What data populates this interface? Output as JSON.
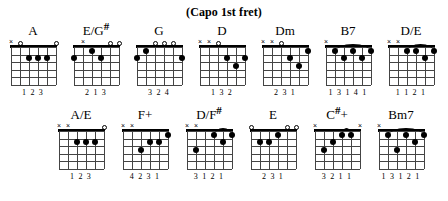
{
  "title": "(Capo 1st fret)",
  "layout": {
    "strings": 6,
    "frets": 5,
    "rows": 2
  },
  "rows": [
    {
      "row_index": 1,
      "chords": [
        {
          "name": "A",
          "name_base": "A",
          "name_sharp": "",
          "markers": [
            "x",
            "o",
            "",
            "",
            "",
            "o"
          ],
          "dots": [
            {
              "string": 4,
              "fret": 2
            },
            {
              "string": 3,
              "fret": 2
            },
            {
              "string": 2,
              "fret": 2
            }
          ],
          "barre": null,
          "fingering": "1 2 3"
        },
        {
          "name": "E/G#",
          "name_base": "E/G",
          "name_sharp": "#",
          "markers": [
            "",
            "x",
            "",
            "",
            "o",
            "o"
          ],
          "dots": [
            {
              "string": 6,
              "fret": 2
            },
            {
              "string": 4,
              "fret": 1
            },
            {
              "string": 3,
              "fret": 2
            }
          ],
          "barre": null,
          "fingering": "2  1 3"
        },
        {
          "name": "G",
          "name_base": "G",
          "name_sharp": "",
          "markers": [
            "",
            "",
            "o",
            "o",
            "o",
            ""
          ],
          "dots": [
            {
              "string": 6,
              "fret": 2
            },
            {
              "string": 5,
              "fret": 1
            },
            {
              "string": 1,
              "fret": 2
            }
          ],
          "barre": null,
          "fingering": "3 2      4"
        },
        {
          "name": "D",
          "name_base": "D",
          "name_sharp": "",
          "markers": [
            "x",
            "x",
            "o",
            "",
            "",
            ""
          ],
          "dots": [
            {
              "string": 3,
              "fret": 2
            },
            {
              "string": 1,
              "fret": 2
            },
            {
              "string": 2,
              "fret": 3
            }
          ],
          "barre": null,
          "fingering": "1 3 2"
        },
        {
          "name": "Dm",
          "name_base": "Dm",
          "name_sharp": "",
          "markers": [
            "x",
            "x",
            "o",
            "",
            "",
            ""
          ],
          "dots": [
            {
              "string": 1,
              "fret": 1
            },
            {
              "string": 3,
              "fret": 2
            },
            {
              "string": 2,
              "fret": 3
            }
          ],
          "barre": null,
          "fingering": "2 3 1"
        },
        {
          "name": "B7",
          "name_base": "B7",
          "name_sharp": "",
          "markers": [
            "x",
            "",
            "",
            "",
            "",
            ""
          ],
          "dots": [
            {
              "string": 5,
              "fret": 1
            },
            {
              "string": 3,
              "fret": 1
            },
            {
              "string": 1,
              "fret": 1
            },
            {
              "string": 4,
              "fret": 2
            },
            {
              "string": 2,
              "fret": 2
            }
          ],
          "barre": {
            "fret": 1,
            "from_string": 5,
            "to_string": 1
          },
          "fingering": "1 3 1 4 1"
        },
        {
          "name": "D/E",
          "name_base": "D/E",
          "name_sharp": "",
          "markers": [
            "x",
            "x",
            "",
            "",
            "",
            ""
          ],
          "dots": [
            {
              "string": 4,
              "fret": 1
            },
            {
              "string": 3,
              "fret": 1
            },
            {
              "string": 1,
              "fret": 1
            },
            {
              "string": 2,
              "fret": 2
            }
          ],
          "barre": {
            "fret": 1,
            "from_string": 4,
            "to_string": 1
          },
          "fingering": "1 1 2 1"
        }
      ]
    },
    {
      "row_index": 2,
      "chords": [
        {
          "name": "A/E",
          "name_base": "A/E",
          "name_sharp": "",
          "markers": [
            "x",
            "x",
            "",
            "",
            "",
            "o"
          ],
          "dots": [
            {
              "string": 4,
              "fret": 2
            },
            {
              "string": 3,
              "fret": 2
            },
            {
              "string": 2,
              "fret": 2
            }
          ],
          "barre": null,
          "fingering": "1 2 3"
        },
        {
          "name": "F+",
          "name_base": "F+",
          "name_sharp": "",
          "markers": [
            "x",
            "x",
            "",
            "",
            "",
            ""
          ],
          "dots": [
            {
              "string": 1,
              "fret": 1
            },
            {
              "string": 3,
              "fret": 2
            },
            {
              "string": 2,
              "fret": 2
            },
            {
              "string": 4,
              "fret": 3
            }
          ],
          "barre": null,
          "fingering": "4 2 3 1"
        },
        {
          "name": "D/F#",
          "name_base": "D/F",
          "name_sharp": "#",
          "markers": [
            "x",
            "x",
            "",
            "",
            "",
            ""
          ],
          "dots": [
            {
              "string": 3,
              "fret": 1
            },
            {
              "string": 1,
              "fret": 1
            },
            {
              "string": 2,
              "fret": 2
            },
            {
              "string": 5,
              "fret": 3
            }
          ],
          "barre": {
            "fret": 1,
            "from_string": 3,
            "to_string": 1
          },
          "fingering": "3 1 2 1"
        },
        {
          "name": "E",
          "name_base": "E",
          "name_sharp": "",
          "markers": [
            "o",
            "",
            "",
            "",
            "o",
            "o"
          ],
          "dots": [
            {
              "string": 5,
              "fret": 2
            },
            {
              "string": 4,
              "fret": 2
            },
            {
              "string": 3,
              "fret": 1
            }
          ],
          "barre": null,
          "fingering": "2 3 1"
        },
        {
          "name": "C#+",
          "name_base": "C",
          "name_sharp": "#",
          "name_suffix": "+",
          "markers": [
            "x",
            "",
            "",
            "",
            "",
            "x"
          ],
          "dots": [
            {
              "string": 3,
              "fret": 1
            },
            {
              "string": 2,
              "fret": 1
            },
            {
              "string": 4,
              "fret": 2
            },
            {
              "string": 5,
              "fret": 3
            }
          ],
          "barre": {
            "fret": 1,
            "from_string": 3,
            "to_string": 2
          },
          "fingering": "3 2 1 1"
        },
        {
          "name": "Bm7",
          "name_base": "Bm7",
          "name_sharp": "",
          "markers": [
            "x",
            "",
            "",
            "",
            "",
            ""
          ],
          "dots": [
            {
              "string": 5,
              "fret": 1
            },
            {
              "string": 3,
              "fret": 1
            },
            {
              "string": 1,
              "fret": 1
            },
            {
              "string": 2,
              "fret": 2
            },
            {
              "string": 4,
              "fret": 3
            }
          ],
          "barre": {
            "fret": 1,
            "from_string": 5,
            "to_string": 1
          },
          "fingering": "1 3 1 2 1"
        }
      ]
    }
  ]
}
